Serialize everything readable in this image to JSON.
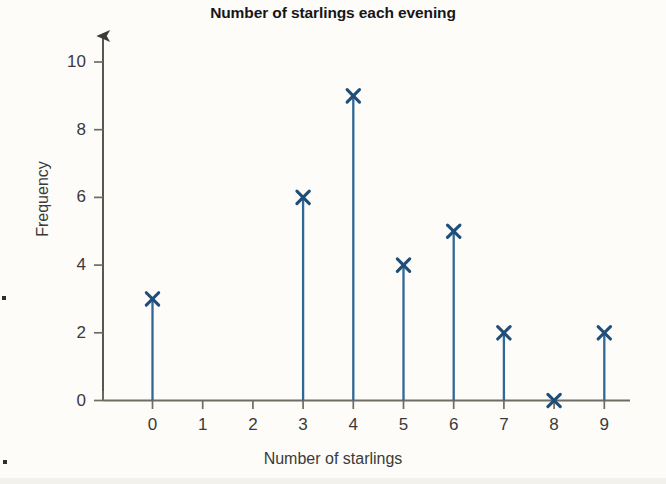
{
  "chart_data": {
    "type": "line",
    "plot_style": "vertical-line-with-cross-markers",
    "title": "Number of starlings each evening",
    "xlabel": "Number of starlings",
    "ylabel": "Frequency",
    "categories": [
      "0",
      "1",
      "2",
      "3",
      "4",
      "5",
      "6",
      "7",
      "8",
      "9"
    ],
    "x": [
      0,
      1,
      2,
      3,
      4,
      5,
      6,
      7,
      8,
      9
    ],
    "values": [
      3,
      null,
      null,
      6,
      9,
      4,
      5,
      2,
      0,
      2
    ],
    "series": [
      {
        "name": "Frequency",
        "values": [
          3,
          null,
          null,
          6,
          9,
          4,
          5,
          2,
          0,
          2
        ]
      }
    ],
    "plotted_points": [
      {
        "x": 0,
        "y": 3
      },
      {
        "x": 3,
        "y": 6
      },
      {
        "x": 4,
        "y": 9
      },
      {
        "x": 5,
        "y": 4
      },
      {
        "x": 6,
        "y": 5
      },
      {
        "x": 7,
        "y": 2
      },
      {
        "x": 8,
        "y": 0
      },
      {
        "x": 9,
        "y": 2
      }
    ],
    "xlim": [
      -1,
      10
    ],
    "ylim": [
      0,
      10.8
    ],
    "xticks": [
      0,
      1,
      2,
      3,
      4,
      5,
      6,
      7,
      8,
      9
    ],
    "xtick_labels": [
      "0",
      "1",
      "2",
      "3",
      "4",
      "5",
      "6",
      "7",
      "8",
      "9"
    ],
    "yticks": [
      0,
      2,
      4,
      6,
      8,
      10
    ],
    "ytick_labels": [
      "0",
      "2",
      "4",
      "6",
      "8",
      "10"
    ],
    "grid": false,
    "legend": null,
    "marker": "cross",
    "colors": {
      "series": "#2f6795",
      "marker": "#1f4e79",
      "axis": "#6e6d61",
      "title_text": "#17161a",
      "label_text": "#3a3a3a",
      "background": "#fdfcf9"
    }
  }
}
